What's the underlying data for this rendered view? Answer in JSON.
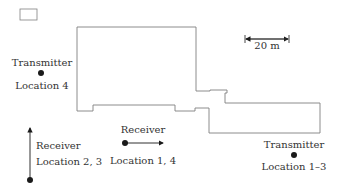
{
  "scale_bar": {
    "label": "20 m"
  },
  "markers": {
    "tx4": {
      "title": "Transmitter",
      "location": "Location 4"
    },
    "tx13": {
      "title": "Transmitter",
      "location": "Location 1–3"
    },
    "rx23": {
      "title": "Receiver",
      "location": "Location 2, 3"
    },
    "rx14": {
      "title": "Receiver",
      "location": "Location 1, 4"
    }
  },
  "colors": {
    "line": "#808080",
    "marker": "#1a1a1a"
  }
}
